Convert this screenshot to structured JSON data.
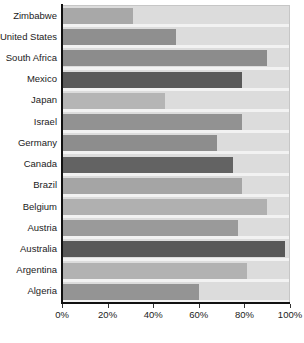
{
  "chart_data": {
    "type": "bar",
    "orientation": "horizontal",
    "title": "",
    "subtitle": "",
    "xlabel": "",
    "ylabel": "",
    "xlim": [
      0,
      100
    ],
    "xtick_labels": [
      "0%",
      "20%",
      "40%",
      "60%",
      "80%",
      "100%"
    ],
    "xtick_values": [
      0,
      20,
      40,
      60,
      80,
      100
    ],
    "grid": false,
    "legend": null,
    "plot_background_color": "#dcdcdc",
    "axis_color": "#111111",
    "categories": [
      "Zimbabwe",
      "United States",
      "South Africa",
      "Mexico",
      "Japan",
      "Israel",
      "Germany",
      "Canada",
      "Brazil",
      "Belgium",
      "Austria",
      "Australia",
      "Argentina",
      "Algeria"
    ],
    "values": [
      31,
      50,
      90,
      79,
      45,
      79,
      68,
      75,
      79,
      90,
      77,
      98,
      81,
      60
    ],
    "bar_colors": [
      "#a8a8a8",
      "#8f8f8f",
      "#8c8c8c",
      "#595959",
      "#b5b5b5",
      "#929292",
      "#8d8d8d",
      "#636363",
      "#a5a5a5",
      "#b0b0b0",
      "#9a9a9a",
      "#585858",
      "#b2b2b2",
      "#949494"
    ]
  }
}
